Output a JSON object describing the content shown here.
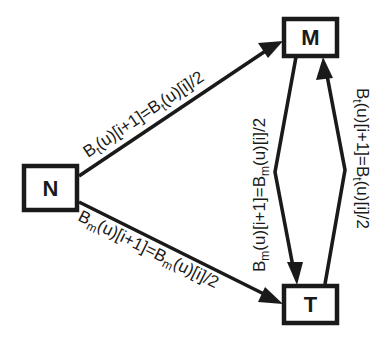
{
  "diagram": {
    "type": "state-transition",
    "colors": {
      "stroke": "#1a1a1a",
      "background": "#ffffff"
    },
    "nodes": [
      {
        "id": "N",
        "label": "N"
      },
      {
        "id": "M",
        "label": "M"
      },
      {
        "id": "T",
        "label": "T"
      }
    ],
    "edges": [
      {
        "from": "N",
        "to": "M",
        "label": {
          "b1": "B",
          "s1": "t",
          "mid": "(u)[i+1]=",
          "b2": "B",
          "s2": "t",
          "end": "(u)[i]/2"
        },
        "text": "B_t(u)[i+1]=B_t(u)[i]/2"
      },
      {
        "from": "N",
        "to": "T",
        "label": {
          "b1": "B",
          "s1": "m",
          "mid": "(u)[i+1]=",
          "b2": "B",
          "s2": "m",
          "end": "(u)[i]/2"
        },
        "text": "B_m(u)[i+1]=B_m(u)[i]/2"
      },
      {
        "from": "M",
        "to": "T",
        "label": {
          "b1": "B",
          "s1": "m",
          "mid": "(u)[i+1]=",
          "b2": "B",
          "s2": "m",
          "end": "(u)[i]/2"
        },
        "text": "B_m(u)[i+1]=B_m(u)[i]/2"
      },
      {
        "from": "T",
        "to": "M",
        "label": {
          "b1": "B",
          "s1": "t",
          "mid": "(u)[i+1]=",
          "b2": "B",
          "s2": "t",
          "end": "(u)[i]/2"
        },
        "text": "B_t(u)[i+1]=B_t(u)[i]/2"
      }
    ]
  }
}
